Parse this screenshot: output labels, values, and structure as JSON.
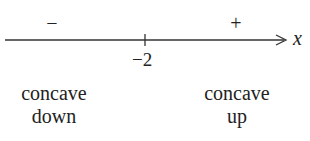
{
  "diagram": {
    "axis_variable": "x",
    "critical_point": "−2",
    "regions": [
      {
        "sign": "−",
        "label_line1": "concave",
        "label_line2": "down"
      },
      {
        "sign": "+",
        "label_line1": "concave",
        "label_line2": "up"
      }
    ],
    "line_color": "#333333"
  }
}
